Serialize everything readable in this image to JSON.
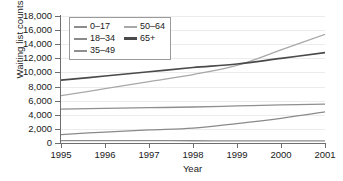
{
  "chart_data": {
    "type": "line",
    "title": "",
    "xlabel": "Year",
    "ylabel": "Waiting list counts",
    "x": [
      1995,
      1996,
      1997,
      1998,
      1999,
      2000,
      2001
    ],
    "xtick_labels": [
      "1995",
      "1996",
      "1997",
      "1998",
      "1999",
      "2000",
      "2001"
    ],
    "ytick_labels": [
      "0",
      "2,000",
      "4,000",
      "6,000",
      "8,000",
      "10,000",
      "12,000",
      "14,000",
      "16,000",
      "18,000"
    ],
    "ytick_values": [
      0,
      2000,
      4000,
      6000,
      8000,
      10000,
      12000,
      14000,
      16000,
      18000
    ],
    "xlim": [
      1995,
      2001
    ],
    "ylim": [
      0,
      18000
    ],
    "grid": true,
    "legend_position": "upper-left-inside",
    "series": [
      {
        "name": "0–17",
        "color": "#8c8c8c",
        "values": [
          350,
          340,
          330,
          320,
          310,
          300,
          300
        ]
      },
      {
        "name": "18–34",
        "color": "#8a8a8a",
        "values": [
          1200,
          1550,
          1850,
          2100,
          2750,
          3500,
          4400
        ]
      },
      {
        "name": "35–49",
        "color": "#8f8f8f",
        "values": [
          4800,
          4900,
          5000,
          5100,
          5250,
          5400,
          5500
        ]
      },
      {
        "name": "50–64",
        "color": "#a8a8a8",
        "values": [
          6700,
          7700,
          8700,
          9700,
          11000,
          13200,
          15400
        ]
      },
      {
        "name": "65+",
        "color": "#4a4a4a",
        "values": [
          8900,
          9500,
          10100,
          10700,
          11200,
          12000,
          12800
        ]
      }
    ],
    "legend_columns": [
      [
        "0–17",
        "18–34",
        "35–49"
      ],
      [
        "50–64",
        "65+"
      ]
    ]
  }
}
